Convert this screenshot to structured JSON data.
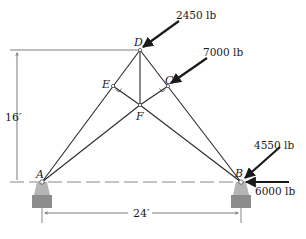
{
  "diagram": {
    "type": "truss",
    "joints": {
      "A": {
        "label": "A",
        "x": 42,
        "y": 182
      },
      "B": {
        "label": "B",
        "x": 241,
        "y": 182
      },
      "C": {
        "label": "C",
        "x": 168,
        "y": 86
      },
      "D": {
        "label": "D",
        "x": 140,
        "y": 50
      },
      "E": {
        "label": "E",
        "x": 113,
        "y": 86
      },
      "F": {
        "label": "F",
        "x": 140,
        "y": 105
      }
    },
    "members": [
      [
        "A",
        "D"
      ],
      [
        "D",
        "B"
      ],
      [
        "D",
        "F"
      ],
      [
        "E",
        "F"
      ],
      [
        "C",
        "F"
      ],
      [
        "A",
        "F"
      ],
      [
        "F",
        "B"
      ]
    ],
    "loads": [
      {
        "joint": "D",
        "label": "2450 lb"
      },
      {
        "joint": "C",
        "label": "7000 lb"
      },
      {
        "joint": "B",
        "label": "4550 lb"
      },
      {
        "joint": "B",
        "label": "6000 lb"
      }
    ],
    "dimensions": {
      "height": "16′",
      "span": "24′"
    },
    "colors": {
      "line": "#2a2a2a",
      "support": "#8c8c8c",
      "support_light": "#b5b5b5"
    }
  }
}
